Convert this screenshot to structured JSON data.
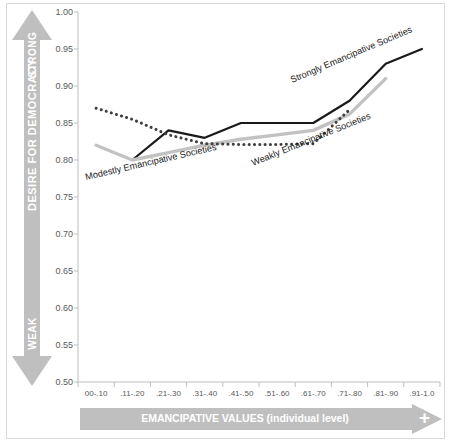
{
  "axes": {
    "y_arrow": {
      "top_label": "STRONG",
      "middle_label": "DESIRE FOR DEMOCRACY",
      "bottom_label": "WEAK",
      "color": "#bfbfbf"
    },
    "x_arrow": {
      "label": "EMANCIPATIVE VALUES (individual level)",
      "plus_sign": "+",
      "color": "#bfbfbf"
    }
  },
  "annotations": {
    "strongly": "Strongly Emancipative Societies",
    "modestly": "Modestly Emancipative Societies",
    "weakly": "Weakly Emancipative Societies"
  },
  "colors": {
    "strongly": "#1a1a1a",
    "modestly": "#c2c2c2",
    "weakly": "#3f3f3f",
    "axis": "#bfbfbf",
    "tick_text": "#595959",
    "background": "#ffffff",
    "border": "#d9d9d9"
  },
  "chart_data": {
    "type": "line",
    "title": "",
    "xlabel": "EMANCIPATIVE VALUES (individual level)",
    "ylabel": "DESIRE FOR DEMOCRACY",
    "grid": false,
    "legend_position": "inline-annotations",
    "categories": [
      "00-.10",
      ".11-.20",
      ".21-.30",
      ".31-.40",
      ".41-.50",
      ".51-.60",
      ".61-.70",
      ".71-.80",
      ".81-.90",
      ".91-1.0"
    ],
    "ylim": [
      0.5,
      1.0
    ],
    "ytick_labels": [
      "1.00",
      "0.95",
      "0.90",
      "0.85",
      "0.80",
      "0.75",
      "0.70",
      "0.65",
      "0.60",
      "0.55",
      "0.50"
    ],
    "ytick_values": [
      1.0,
      0.95,
      0.9,
      0.85,
      0.8,
      0.75,
      0.7,
      0.65,
      0.6,
      0.55,
      0.5
    ],
    "series": [
      {
        "name": "Strongly Emancipative Societies",
        "style": "solid",
        "color": "#1a1a1a",
        "values": [
          null,
          0.8,
          0.84,
          0.83,
          0.85,
          0.85,
          0.85,
          0.88,
          0.93,
          0.95
        ]
      },
      {
        "name": "Modestly Emancipative Societies",
        "style": "solid",
        "color": "#c2c2c2",
        "values": [
          0.82,
          0.8,
          0.81,
          0.82,
          0.828,
          0.834,
          0.84,
          0.862,
          0.91,
          null
        ]
      },
      {
        "name": "Weakly Emancipative Societies",
        "style": "dotted",
        "color": "#3f3f3f",
        "values": [
          0.87,
          0.855,
          0.834,
          0.822,
          0.821,
          0.821,
          0.822,
          0.868,
          null,
          null
        ]
      }
    ]
  }
}
